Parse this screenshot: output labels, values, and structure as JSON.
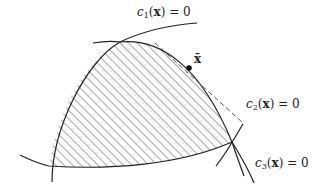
{
  "labels": {
    "c1": {
      "fn": "c",
      "sub": "1",
      "arg": "x",
      "rhs": "= 0"
    },
    "c2": {
      "fn": "c",
      "sub": "2",
      "arg": "x",
      "rhs": "= 0"
    },
    "c3": {
      "fn": "c",
      "sub": "3",
      "arg": "x",
      "rhs": "= 0"
    },
    "xbar": "x̄"
  },
  "colors": {
    "stroke": "#222222",
    "hatch": "#555555",
    "background": "#ffffff"
  }
}
